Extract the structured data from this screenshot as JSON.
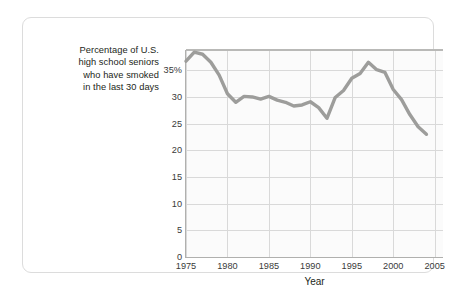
{
  "caption": {
    "lines": [
      "Percentage of U.S.",
      "high school seniors",
      "who have smoked",
      "in the last 30 days"
    ]
  },
  "chart_data": {
    "type": "line",
    "title": "",
    "xlabel": "Year",
    "ylabel": "Percentage of U.S. high school seniors who have smoked in the last 30 days",
    "xlim": [
      1975,
      2006
    ],
    "ylim": [
      0,
      38.8
    ],
    "grid": true,
    "legend": false,
    "line_color": "#9d9d9b",
    "plot_background": "#fbfbfb",
    "grid_color": "#d9d9d9",
    "axis_color": "#b0b0ae",
    "x_ticks": [
      1975,
      1980,
      1985,
      1990,
      1995,
      2000,
      2005
    ],
    "x_tick_labels": [
      "1975",
      "1980",
      "1985",
      "1990",
      "1995",
      "2000",
      "2005"
    ],
    "y_ticks": [
      0,
      5,
      10,
      15,
      20,
      25,
      30,
      35
    ],
    "y_tick_labels": [
      "0",
      "5",
      "10",
      "15",
      "20",
      "25",
      "30",
      "35%"
    ],
    "x": [
      1975,
      1976,
      1977,
      1978,
      1979,
      1980,
      1981,
      1982,
      1983,
      1984,
      1985,
      1986,
      1987,
      1988,
      1989,
      1990,
      1991,
      1992,
      1993,
      1994,
      1995,
      1996,
      1997,
      1998,
      1999,
      2000,
      2001,
      2002,
      2003,
      2004
    ],
    "values": [
      36.7,
      38.4,
      38.0,
      36.5,
      34.1,
      30.6,
      29.0,
      30.1,
      30.0,
      29.6,
      30.1,
      29.4,
      29.0,
      28.3,
      28.5,
      29.1,
      28.0,
      26.0,
      29.9,
      31.2,
      33.5,
      34.4,
      36.5,
      35.1,
      34.6,
      31.4,
      29.5,
      26.7,
      24.4,
      23.0
    ],
    "annotations": []
  }
}
